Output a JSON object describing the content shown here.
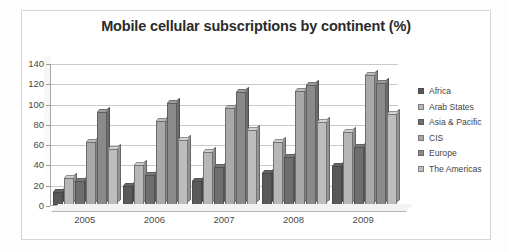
{
  "chart_data": {
    "type": "bar",
    "title": "Mobile cellular subscriptions by continent (%)",
    "xlabel": "",
    "ylabel": "",
    "ylim": [
      0,
      140
    ],
    "yticks": [
      0,
      20,
      40,
      60,
      80,
      100,
      120,
      140
    ],
    "grid": true,
    "legend_position": "right",
    "categories": [
      "2005",
      "2006",
      "2007",
      "2008",
      "2009"
    ],
    "series": [
      {
        "name": "Africa",
        "color": "#595959",
        "values": [
          13,
          19,
          24,
          32,
          38
        ]
      },
      {
        "name": "Arab States",
        "color": "#b7b7b7",
        "values": [
          27,
          39,
          52,
          62,
          72
        ]
      },
      {
        "name": "Asia & Pacific",
        "color": "#6e6e6e",
        "values": [
          24,
          30,
          37,
          47,
          57
        ]
      },
      {
        "name": "CIS",
        "color": "#a9a9a9",
        "values": [
          62,
          83,
          96,
          112,
          128
        ]
      },
      {
        "name": "Europe",
        "color": "#8a8a8a",
        "values": [
          92,
          101,
          111,
          118,
          120
        ]
      },
      {
        "name": "The Americas",
        "color": "#bdbdbd",
        "values": [
          55,
          64,
          74,
          82,
          90
        ]
      }
    ]
  }
}
